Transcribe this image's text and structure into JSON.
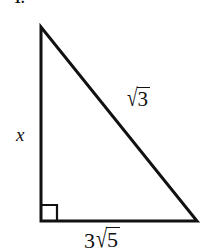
{
  "figure": {
    "kind": "right-triangle-diagram",
    "problem_number": "1.",
    "background_color": "#ffffff",
    "stroke_color": "#111111",
    "stroke_width": 3,
    "vertices": {
      "apex": {
        "x": 41,
        "y": 27
      },
      "bottom_left": {
        "x": 41,
        "y": 221
      },
      "bottom_right": {
        "x": 197,
        "y": 221
      }
    },
    "right_angle_marker": {
      "at": "bottom_left",
      "size": 16,
      "present": true
    },
    "labels": {
      "leg_vertical": {
        "text": "x",
        "style": "italic",
        "position": {
          "x": 16,
          "y": 125
        }
      },
      "hypotenuse": {
        "coefficient": "",
        "radical_symbol": "√",
        "radicand": "3",
        "full_text": "√3",
        "position": {
          "x": 126,
          "y": 88
        }
      },
      "base": {
        "coefficient": "3",
        "radical_symbol": "√",
        "radicand": "5",
        "full_text": "3√5",
        "position": {
          "x": 84,
          "y": 228
        }
      }
    }
  }
}
